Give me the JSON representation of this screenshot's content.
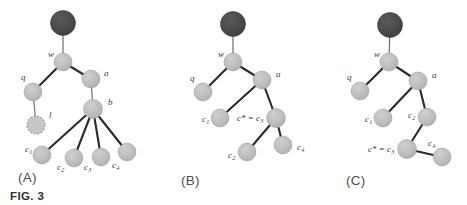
{
  "figure": {
    "caption": "FIG. 3",
    "colors": {
      "root_node": "#4a4a4a",
      "node": "#b9b9b9",
      "node_stroke": "#a3a3a3",
      "dashed_node_fill": "#c6c6c6",
      "dashed_node_stroke": "#9a9a9a",
      "edge": "#2b2b2b",
      "thin_edge": "#6f6f6f",
      "label_text": "#3a3a3a",
      "panel_label_text": "#4d4d4d",
      "caption_text": "#2e2e2e",
      "background": "#ffffff"
    },
    "panels": [
      {
        "id": "A",
        "label": "(A)",
        "label_x": 18,
        "label_y": 170,
        "nodes": [
          {
            "id": "root",
            "x": 63,
            "y": 23,
            "r": 12.5,
            "kind": "root",
            "label": "",
            "sub": "",
            "label_x": 0,
            "label_y": 0
          },
          {
            "id": "w",
            "x": 63,
            "y": 62,
            "r": 9,
            "kind": "plain",
            "label": "w",
            "sub": "",
            "label_x": 48,
            "label_y": 57
          },
          {
            "id": "q",
            "x": 33,
            "y": 92,
            "r": 9,
            "kind": "plain",
            "label": "q",
            "sub": "",
            "label_x": 21,
            "label_y": 80
          },
          {
            "id": "l",
            "x": 36,
            "y": 125,
            "r": 9,
            "kind": "dashed",
            "label": "l",
            "sub": "",
            "label_x": 49,
            "label_y": 118
          },
          {
            "id": "a",
            "x": 91,
            "y": 79,
            "r": 9,
            "kind": "plain",
            "label": "a",
            "sub": "",
            "label_x": 104,
            "label_y": 76
          },
          {
            "id": "b",
            "x": 93,
            "y": 109,
            "r": 9.5,
            "kind": "plain",
            "label": "b",
            "sub": "",
            "label_x": 108,
            "label_y": 105
          },
          {
            "id": "c1",
            "x": 42,
            "y": 155,
            "r": 9,
            "kind": "plain",
            "label": "c",
            "sub": "1",
            "label_x": 25,
            "label_y": 152
          },
          {
            "id": "c2",
            "x": 74,
            "y": 158,
            "r": 9,
            "kind": "plain",
            "label": "c",
            "sub": "2",
            "label_x": 57,
            "label_y": 170
          },
          {
            "id": "c3",
            "x": 101,
            "y": 157,
            "r": 9,
            "kind": "plain",
            "label": "c",
            "sub": "3",
            "label_x": 84,
            "label_y": 170
          },
          {
            "id": "c4",
            "x": 127,
            "y": 152,
            "r": 9,
            "kind": "plain",
            "label": "c",
            "sub": "4",
            "label_x": 112,
            "label_y": 168
          }
        ],
        "edges": [
          {
            "from": "root",
            "to": "w",
            "weight": "thin"
          },
          {
            "from": "w",
            "to": "q",
            "weight": "thick"
          },
          {
            "from": "q",
            "to": "l",
            "weight": "thin"
          },
          {
            "from": "w",
            "to": "a",
            "weight": "thick"
          },
          {
            "from": "a",
            "to": "b",
            "weight": "thin"
          },
          {
            "from": "b",
            "to": "c1",
            "weight": "thick"
          },
          {
            "from": "b",
            "to": "c2",
            "weight": "thick"
          },
          {
            "from": "b",
            "to": "c3",
            "weight": "thick"
          },
          {
            "from": "b",
            "to": "c4",
            "weight": "thick"
          }
        ]
      },
      {
        "id": "B",
        "label": "(B)",
        "label_x": 181,
        "label_y": 173,
        "nodes": [
          {
            "id": "root",
            "x": 233,
            "y": 24,
            "r": 12.5,
            "kind": "root",
            "label": "",
            "sub": "",
            "label_x": 0,
            "label_y": 0
          },
          {
            "id": "w",
            "x": 233,
            "y": 62,
            "r": 9,
            "kind": "plain",
            "label": "w",
            "sub": "",
            "label_x": 218,
            "label_y": 57
          },
          {
            "id": "q",
            "x": 203,
            "y": 92,
            "r": 9,
            "kind": "plain",
            "label": "q",
            "sub": "",
            "label_x": 190,
            "label_y": 81
          },
          {
            "id": "a",
            "x": 262,
            "y": 80,
            "r": 9,
            "kind": "plain",
            "label": "a",
            "sub": "",
            "label_x": 276,
            "label_y": 77
          },
          {
            "id": "c1",
            "x": 220,
            "y": 118,
            "r": 9,
            "kind": "plain",
            "label": "c",
            "sub": "1",
            "label_x": 202,
            "label_y": 122
          },
          {
            "id": "c3",
            "x": 276,
            "y": 118,
            "r": 9.5,
            "kind": "plain",
            "label": "c* = c",
            "sub": "3",
            "label_x": 237,
            "label_y": 121
          },
          {
            "id": "c2",
            "x": 247,
            "y": 152,
            "r": 9,
            "kind": "plain",
            "label": "c",
            "sub": "2",
            "label_x": 228,
            "label_y": 158
          },
          {
            "id": "c4",
            "x": 283,
            "y": 145,
            "r": 9,
            "kind": "plain",
            "label": "c",
            "sub": "4",
            "label_x": 297,
            "label_y": 150
          }
        ],
        "edges": [
          {
            "from": "root",
            "to": "w",
            "weight": "thin"
          },
          {
            "from": "w",
            "to": "q",
            "weight": "thick"
          },
          {
            "from": "w",
            "to": "a",
            "weight": "thick"
          },
          {
            "from": "a",
            "to": "c1",
            "weight": "thick"
          },
          {
            "from": "a",
            "to": "c3",
            "weight": "thick"
          },
          {
            "from": "c3",
            "to": "c2",
            "weight": "thick"
          },
          {
            "from": "c3",
            "to": "c4",
            "weight": "thick"
          }
        ]
      },
      {
        "id": "C",
        "label": "(C)",
        "label_x": 346,
        "label_y": 173,
        "nodes": [
          {
            "id": "root",
            "x": 390,
            "y": 25,
            "r": 12.5,
            "kind": "root",
            "label": "",
            "sub": "",
            "label_x": 0,
            "label_y": 0
          },
          {
            "id": "w",
            "x": 389,
            "y": 62,
            "r": 9,
            "kind": "plain",
            "label": "w",
            "sub": "",
            "label_x": 374,
            "label_y": 57
          },
          {
            "id": "q",
            "x": 360,
            "y": 91,
            "r": 9,
            "kind": "plain",
            "label": "q",
            "sub": "",
            "label_x": 347,
            "label_y": 80
          },
          {
            "id": "a",
            "x": 418,
            "y": 81,
            "r": 9,
            "kind": "plain",
            "label": "a",
            "sub": "",
            "label_x": 432,
            "label_y": 78
          },
          {
            "id": "c1",
            "x": 383,
            "y": 118,
            "r": 9,
            "kind": "plain",
            "label": "c",
            "sub": "1",
            "label_x": 365,
            "label_y": 122
          },
          {
            "id": "c2",
            "x": 427,
            "y": 117,
            "r": 9,
            "kind": "plain",
            "label": "c",
            "sub": "2",
            "label_x": 408,
            "label_y": 118
          },
          {
            "id": "c3",
            "x": 407,
            "y": 149,
            "r": 9.5,
            "kind": "plain",
            "label": "c* = c",
            "sub": "3",
            "label_x": 368,
            "label_y": 152
          },
          {
            "id": "c4",
            "x": 442,
            "y": 157,
            "r": 9,
            "kind": "plain",
            "label": "c",
            "sub": "4",
            "label_x": 428,
            "label_y": 146
          }
        ],
        "edges": [
          {
            "from": "root",
            "to": "w",
            "weight": "thin"
          },
          {
            "from": "w",
            "to": "q",
            "weight": "thick"
          },
          {
            "from": "w",
            "to": "a",
            "weight": "thick"
          },
          {
            "from": "a",
            "to": "c1",
            "weight": "thick"
          },
          {
            "from": "a",
            "to": "c2",
            "weight": "thick"
          },
          {
            "from": "c2",
            "to": "c3",
            "weight": "thick"
          },
          {
            "from": "c3",
            "to": "c4",
            "weight": "thick"
          }
        ]
      }
    ]
  }
}
